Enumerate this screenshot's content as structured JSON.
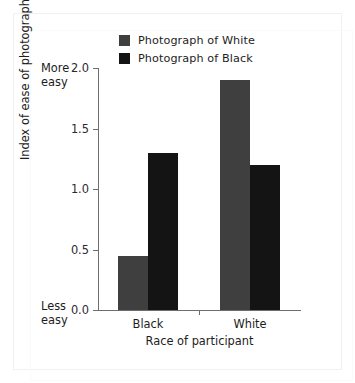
{
  "figure": {
    "background": "#ffffff",
    "frame_color": "#f1f1f1"
  },
  "legend": {
    "position": "top-center",
    "items": [
      {
        "label": "Photograph of White",
        "color": "#3f3f3f",
        "swatch_name": "legend-swatch-photograph-of-white"
      },
      {
        "label": "Photograph of Black",
        "color": "#141414",
        "swatch_name": "legend-swatch-photograph-of-black"
      }
    ]
  },
  "axes": {
    "y": {
      "label": "Index of ease of photograph recognition",
      "ticks": [
        "0.0",
        "0.5",
        "1.0",
        "1.5",
        "2.0"
      ],
      "tick_values": [
        0.0,
        0.5,
        1.0,
        1.5,
        2.0
      ],
      "min": 0.0,
      "max": 2.0,
      "anchor_high": "More\neasy",
      "anchor_high_line1": "More",
      "anchor_high_line2": "easy",
      "anchor_low_line1": "Less",
      "anchor_low_line2": "easy"
    },
    "x": {
      "label": "Race of participant",
      "categories": [
        "Black",
        "White"
      ]
    }
  },
  "chart_data": {
    "type": "bar",
    "title": "",
    "xlabel": "Race of participant",
    "ylabel": "Index of ease of photograph recognition",
    "categories": [
      "Black",
      "White"
    ],
    "series": [
      {
        "name": "Photograph of White",
        "color": "#3f3f3f",
        "values": [
          0.45,
          1.9
        ]
      },
      {
        "name": "Photograph of Black",
        "color": "#141414",
        "values": [
          1.3,
          1.2
        ]
      }
    ],
    "ylim": [
      0.0,
      2.0
    ],
    "yticks": [
      0.0,
      0.5,
      1.0,
      1.5,
      2.0
    ],
    "grid": false,
    "legend_position": "top-center",
    "y_axis_anchors": {
      "top": "More easy",
      "bottom": "Less easy"
    }
  }
}
